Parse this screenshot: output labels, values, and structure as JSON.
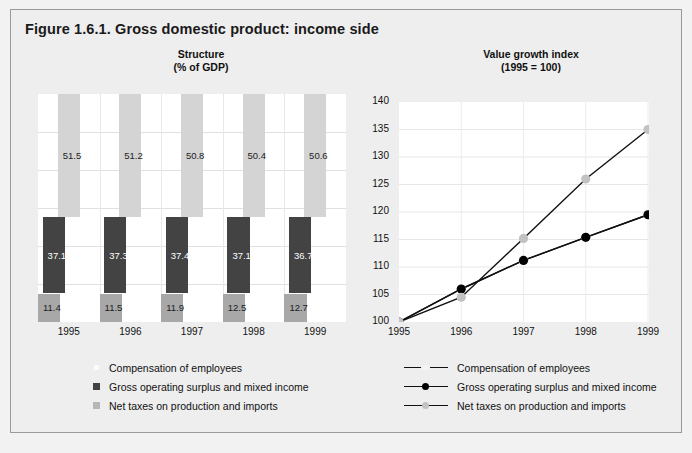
{
  "figure": {
    "title": "Figure 1.6.1. Gross domestic product: income side"
  },
  "left_panel": {
    "title_line1": "Structure",
    "title_line2": "(% of GDP)"
  },
  "right_panel": {
    "title_line1": "Value growth index",
    "title_line2": "(1995 = 100)"
  },
  "legend_left": {
    "items": [
      {
        "label": "Compensation of employees",
        "color": "#fbfbfb"
      },
      {
        "label": "Gross operating surplus and mixed income",
        "color": "#434343"
      },
      {
        "label": "Net taxes on production and imports",
        "color": "#b6b6b6"
      }
    ]
  },
  "legend_right": {
    "items": [
      {
        "label": "Compensation of employees",
        "color": "#f4f4f4"
      },
      {
        "label": "Gross operating surplus and mixed income",
        "color": "#000000"
      },
      {
        "label": "Net taxes on production and imports",
        "color": "#c2c2c2"
      }
    ]
  },
  "chart_data": [
    {
      "type": "bar",
      "title": "Structure (% of GDP)",
      "xlabel": "",
      "ylabel": "% of GDP",
      "categories": [
        "1995",
        "1996",
        "1997",
        "1998",
        "1999"
      ],
      "ylim": [
        0,
        60
      ],
      "grid": true,
      "legend_position": "below",
      "note": "Three offset bars per year, each drawn at its own vertical band (not stacked).",
      "series": [
        {
          "name": "Compensation of employees",
          "color": "#d4d4d4",
          "values": [
            51.5,
            51.2,
            50.8,
            50.4,
            50.6
          ],
          "labels": [
            "51.5",
            "51.2",
            "50.8",
            "50.4",
            "50.6"
          ]
        },
        {
          "name": "Gross operating surplus and mixed income",
          "color": "#434343",
          "values": [
            37.1,
            37.3,
            37.4,
            37.1,
            36.7
          ],
          "labels": [
            "37.1",
            "37.3",
            "37.4",
            "37.1",
            "36.7"
          ]
        },
        {
          "name": "Net taxes on production and imports",
          "color": "#a8a8a8",
          "values": [
            11.4,
            11.5,
            11.9,
            12.5,
            12.7
          ],
          "labels": [
            "11.4",
            "11.5",
            "11.9",
            "12.5",
            "12.7"
          ]
        }
      ]
    },
    {
      "type": "line",
      "title": "Value growth index (1995 = 100)",
      "xlabel": "",
      "ylabel": "",
      "x": [
        "1995",
        "1996",
        "1997",
        "1998",
        "1999"
      ],
      "ylim": [
        100,
        140
      ],
      "yticks": [
        100,
        105,
        110,
        115,
        120,
        125,
        130,
        135,
        140
      ],
      "grid": true,
      "legend_position": "below",
      "series": [
        {
          "name": "Compensation of employees",
          "color": "#f4f4f4",
          "marker": "circle",
          "values": [
            100,
            106,
            111.2,
            115.4,
            119.5
          ]
        },
        {
          "name": "Gross operating surplus and mixed income",
          "color": "#000000",
          "marker": "circle",
          "values": [
            100,
            106,
            111.2,
            115.4,
            119.5
          ]
        },
        {
          "name": "Net taxes on production and imports",
          "color": "#c2c2c2",
          "marker": "circle",
          "values": [
            100,
            104.5,
            115.2,
            126,
            135
          ]
        }
      ]
    }
  ]
}
